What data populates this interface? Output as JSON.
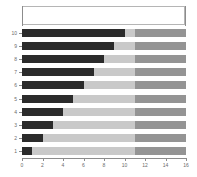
{
  "chart_data": {
    "type": "bar",
    "orientation": "horizontal",
    "stacked": true,
    "title": "",
    "xlabel": "",
    "ylabel": "",
    "xlim": [
      0,
      16
    ],
    "ylim": [
      0.5,
      10.5
    ],
    "grid": false,
    "legend_position": "top",
    "legend_entries": [],
    "xticks": [
      0,
      2,
      4,
      6,
      8,
      10,
      12,
      14,
      16
    ],
    "xticklabels": [
      "0",
      "2",
      "4",
      "6",
      "8",
      "10",
      "12",
      "14",
      "16"
    ],
    "categories": [
      "10",
      "9",
      "8",
      "7",
      "6",
      "5",
      "4",
      "3",
      "2",
      "1"
    ],
    "series": [
      {
        "name": "series-1",
        "color": "#2b2b2b",
        "values": [
          10,
          9,
          8,
          7,
          6,
          5,
          4,
          3,
          2,
          1
        ]
      },
      {
        "name": "series-2",
        "color": "#c9c9c9",
        "values": [
          1,
          2,
          3,
          4,
          5,
          6,
          7,
          8,
          9,
          10
        ]
      },
      {
        "name": "series-3",
        "color": "#949494",
        "values": [
          5,
          5,
          5,
          5,
          5,
          5,
          5,
          5,
          5,
          5
        ]
      }
    ]
  },
  "colors": {
    "series_1": "#2b2b2b",
    "series_2": "#c9c9c9",
    "series_3": "#949494",
    "axis": "#8c8c8c",
    "tick_text": "#6b6b6b",
    "legend_border": "#b5b5b5",
    "background": "#ffffff"
  }
}
